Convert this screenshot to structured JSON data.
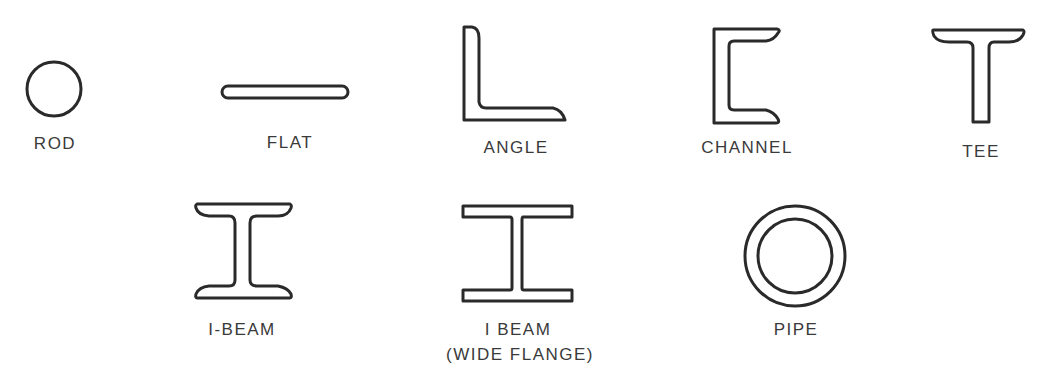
{
  "diagram": {
    "type": "structural-steel-shapes",
    "shapes": [
      {
        "id": "rod",
        "label": "ROD"
      },
      {
        "id": "flat",
        "label": "FLAT"
      },
      {
        "id": "angle",
        "label": "ANGLE"
      },
      {
        "id": "channel",
        "label": "CHANNEL"
      },
      {
        "id": "tee",
        "label": "TEE"
      },
      {
        "id": "i-beam",
        "label": "I-BEAM"
      },
      {
        "id": "wide-flange",
        "label": "I BEAM",
        "sublabel": "(WIDE FLANGE)"
      },
      {
        "id": "pipe",
        "label": "PIPE"
      }
    ],
    "stroke_color": "#2a2a2a",
    "text_color": "#3a3a3a",
    "background": "#ffffff"
  }
}
